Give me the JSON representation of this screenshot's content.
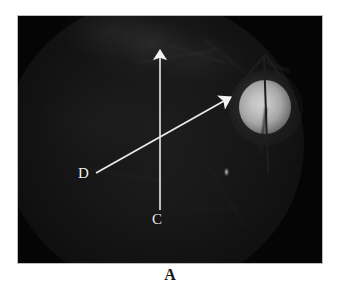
{
  "figure": {
    "domain": "medical-fundus-photograph",
    "panel_caption": "A",
    "photo": {
      "alt_name": "retinal-fundus-photograph",
      "background_color": "#0a0a0a",
      "frame_color": "#bdbdbd"
    },
    "annotations": {
      "marker_color": "#f2f2f2",
      "labels": [
        {
          "id": "label-c",
          "text": "C",
          "x": 158,
          "y": 221
        },
        {
          "id": "label-d",
          "text": "D",
          "x": 83,
          "y": 178
        }
      ],
      "arrows": [
        {
          "id": "arrow-c",
          "label": "C",
          "orientation": "vertical",
          "tail_x": 160,
          "tail_y": 210,
          "tip_x": 160,
          "tip_y": 48
        },
        {
          "id": "arrow-d",
          "label": "D",
          "orientation": "diagonal",
          "tail_x": 96,
          "tail_y": 173,
          "tip_x": 231,
          "tip_y": 97
        }
      ]
    },
    "features": [
      {
        "name": "optic-disc",
        "description": "bright optic disc",
        "cx": 262,
        "cy": 106,
        "rx": 27,
        "ry": 28,
        "color": "#c2c2c2"
      },
      {
        "name": "retinal-vessels",
        "description": "dark branching vessels over optic disc",
        "color": "#1e1e1e"
      },
      {
        "name": "macular-reflex",
        "description": "small bright reflex spot",
        "cx": 226,
        "cy": 172
      }
    ]
  }
}
